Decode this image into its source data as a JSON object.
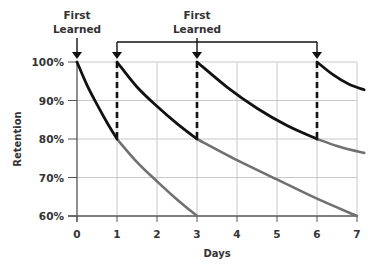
{
  "chart_data": {
    "type": "line",
    "title": "",
    "xlabel": "Days",
    "ylabel": "Retention",
    "xlim": [
      0,
      7
    ],
    "ylim": [
      60,
      100
    ],
    "x_ticks": [
      "0",
      "1",
      "2",
      "3",
      "4",
      "5",
      "6",
      "7"
    ],
    "y_ticks": [
      "60%",
      "70%",
      "80%",
      "90%",
      "100%"
    ],
    "y_tick_values": [
      60,
      70,
      80,
      90,
      100
    ],
    "grid": true,
    "annotations": [
      {
        "text_line1": "First",
        "text_line2": "Learned",
        "points_to_days": [
          0
        ]
      },
      {
        "text_line1": "First",
        "text_line2": "Learned",
        "points_to_days": [
          1,
          3,
          6
        ]
      }
    ],
    "review_days": [
      1,
      3,
      6
    ],
    "colors": {
      "active": "#111111",
      "forgotten": "#707070",
      "grid": "#c8c8c8",
      "axis": "#555555",
      "dashed": "#111111"
    },
    "series": [
      {
        "name": "learning-day-0-active",
        "style": "active",
        "points": [
          [
            0,
            100
          ],
          [
            0.25,
            94
          ],
          [
            0.5,
            89
          ],
          [
            0.75,
            84.3
          ],
          [
            1,
            80
          ]
        ]
      },
      {
        "name": "learning-day-0-forgotten",
        "style": "forgotten",
        "points": [
          [
            1,
            80
          ],
          [
            1.5,
            74
          ],
          [
            2,
            69
          ],
          [
            2.5,
            64.3
          ],
          [
            3,
            60
          ]
        ]
      },
      {
        "name": "review-day-1-active",
        "style": "active",
        "points": [
          [
            1,
            100
          ],
          [
            1.5,
            93.5
          ],
          [
            2,
            88.5
          ],
          [
            2.5,
            84
          ],
          [
            3,
            80
          ]
        ]
      },
      {
        "name": "review-day-1-forgotten",
        "style": "forgotten",
        "points": [
          [
            3,
            80
          ],
          [
            4,
            74.5
          ],
          [
            5,
            69.5
          ],
          [
            6,
            64.5
          ],
          [
            7,
            60
          ]
        ]
      },
      {
        "name": "review-day-3-active",
        "style": "active",
        "points": [
          [
            3,
            100
          ],
          [
            3.75,
            93.5
          ],
          [
            4.5,
            88
          ],
          [
            5.25,
            83.5
          ],
          [
            6,
            80
          ]
        ]
      },
      {
        "name": "review-day-3-forgotten",
        "style": "forgotten",
        "points": [
          [
            6,
            80
          ],
          [
            6.5,
            78.2
          ],
          [
            7,
            76.8
          ],
          [
            7.18,
            76.4
          ]
        ]
      },
      {
        "name": "review-day-6-active",
        "style": "active",
        "points": [
          [
            6,
            100
          ],
          [
            6.4,
            96.7
          ],
          [
            6.8,
            94.2
          ],
          [
            7.18,
            92.8
          ]
        ]
      }
    ]
  }
}
